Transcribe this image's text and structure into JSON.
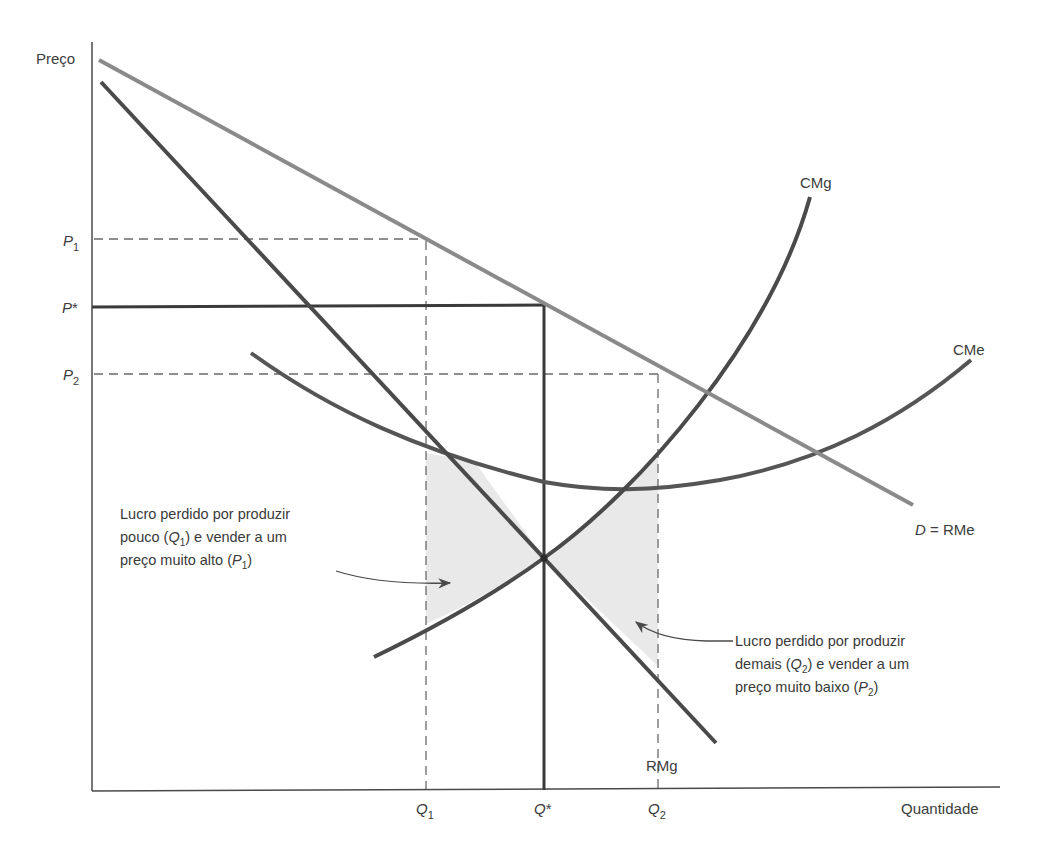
{
  "diagram": {
    "axes": {
      "y_label": "Preço",
      "x_label": "Quantidade"
    },
    "price_labels": {
      "p1": {
        "base": "P",
        "sub": "1"
      },
      "pstar": {
        "base": "P",
        "sup": "*"
      },
      "p2": {
        "base": "P",
        "sub": "2"
      }
    },
    "quantity_labels": {
      "q1": {
        "base": "Q",
        "sub": "1"
      },
      "qstar": {
        "base": "Q",
        "sup": "*"
      },
      "q2": {
        "base": "Q",
        "sub": "2"
      }
    },
    "curves": {
      "demand": {
        "label_italic": "D",
        "label_rest": " = RMe",
        "color": "#8a8a8a"
      },
      "marginal_revenue": {
        "label": "RMg",
        "color": "#4a4a4a"
      },
      "marginal_cost": {
        "label": "CMg",
        "color": "#4a4a4a"
      },
      "average_cost": {
        "label": "CMe",
        "color": "#555555"
      }
    },
    "annotations": {
      "left": {
        "line1": "Lucro perdido por produzir",
        "line2_a": "pouco (",
        "line2_q": "Q",
        "line2_sub": "1",
        "line2_b": ") e vender a um",
        "line3_a": "preço muito alto (",
        "line3_p": "P",
        "line3_sub": "1",
        "line3_b": ")"
      },
      "right": {
        "line1": "Lucro perdido por produzir",
        "line2_a": "demais (",
        "line2_q": "Q",
        "line2_sub": "2",
        "line2_b": ") e vender a um",
        "line3_a": "preço muito baixo (",
        "line3_p": "P",
        "line3_sub": "2",
        "line3_b": ")"
      }
    },
    "colors": {
      "shading": "#e9e9e9",
      "axis": "#4a4a4a",
      "dashed": "#6a6a6a"
    }
  }
}
